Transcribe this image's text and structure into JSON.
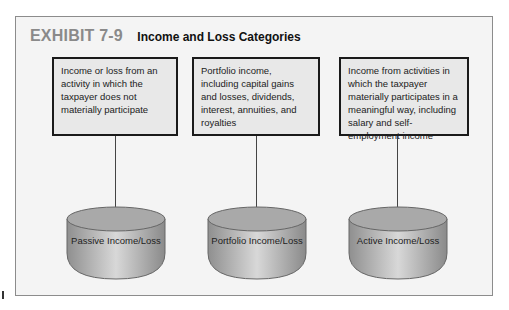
{
  "header": {
    "exhibit_label": "EXHIBIT 7-9",
    "title": "Income and Loss Categories"
  },
  "boxes": [
    {
      "text": "Income or loss from an activity in which the taxpayer does not materially participate"
    },
    {
      "text": "Portfolio income, including capital gains and losses, dividends, interest, annuities, and royalties"
    },
    {
      "text": "Income from activities in which the taxpayer materially participates in a meaningful way, including salary and self-employment income"
    }
  ],
  "categories": [
    {
      "label": "Passive Income/Loss"
    },
    {
      "label": "Portfolio Income/Loss"
    },
    {
      "label": "Active Income/Loss"
    }
  ],
  "colors": {
    "exhibit_label": "#8a8a8a",
    "panel_bg": "#f4f4f4",
    "box_bg": "#e8e8e8",
    "cylinder": "#b0b0b0"
  }
}
